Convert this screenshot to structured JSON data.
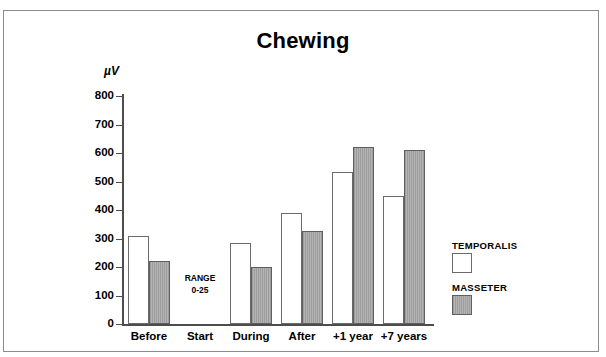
{
  "figure": {
    "title": "Chewing",
    "y_axis_unit_label": "µV",
    "frame_border_color": "#8c8c8c",
    "axis_color": "#4d4d4d"
  },
  "annotations": {
    "range_note_line1": "RANGE",
    "range_note_line2": "0-25"
  },
  "legend": {
    "entries": [
      {
        "label": "TEMPORALIS",
        "swatch": "white",
        "color": "#ffffff"
      },
      {
        "label": "MASSETER",
        "swatch": "gray",
        "color": "#9d9d9d"
      }
    ]
  },
  "chart_data": {
    "type": "bar",
    "title": "Chewing",
    "xlabel": "",
    "ylabel": "µV",
    "ylim": [
      0,
      800
    ],
    "ytick_labels": [
      "800",
      "700",
      "600",
      "500",
      "400",
      "300",
      "200",
      "100",
      "0"
    ],
    "yticks": [
      800,
      700,
      600,
      500,
      400,
      300,
      200,
      100,
      0
    ],
    "grid": false,
    "legend_position": "right",
    "categories": [
      "Before",
      "Start",
      "During",
      "After",
      "+1 year",
      "+7 years"
    ],
    "series": [
      {
        "name": "TEMPORALIS",
        "color": "#ffffff",
        "values": [
          310,
          null,
          285,
          390,
          535,
          450
        ]
      },
      {
        "name": "MASSETER",
        "color": "#9d9d9d",
        "values": [
          220,
          null,
          200,
          325,
          620,
          610
        ]
      }
    ],
    "annotations": [
      {
        "category": "Start",
        "text": "RANGE 0-25",
        "note": "no bars drawn for Start; amplitude within 0-25 range"
      }
    ]
  }
}
